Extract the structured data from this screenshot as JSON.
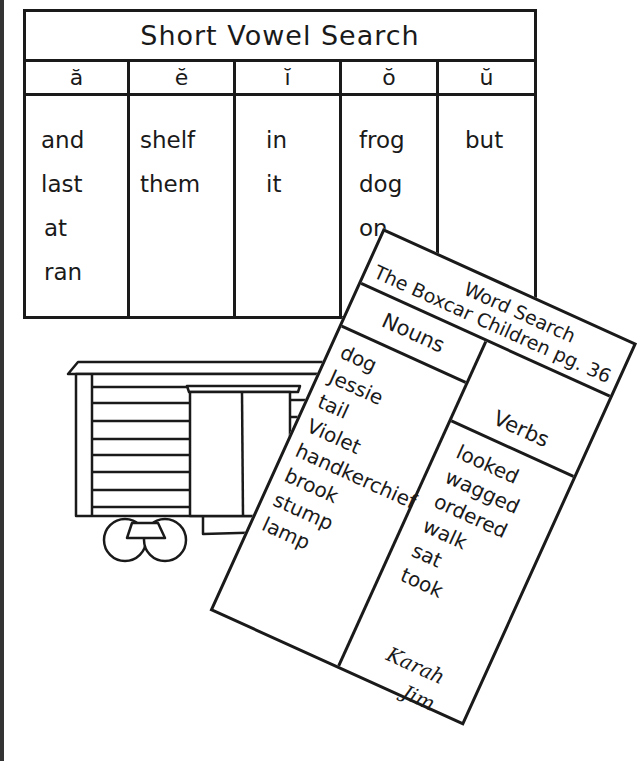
{
  "vowel_table": {
    "title": "Short Vowel Search",
    "columns": [
      {
        "header": "ă",
        "words": [
          "and",
          "last",
          "at",
          "ran"
        ]
      },
      {
        "header": "ĕ",
        "words": [
          "shelf",
          "them"
        ]
      },
      {
        "header": "ĭ",
        "words": [
          "in",
          "it"
        ]
      },
      {
        "header": "ŏ",
        "words": [
          "frog",
          "dog",
          "on"
        ]
      },
      {
        "header": "ŭ",
        "words": [
          "but"
        ]
      }
    ]
  },
  "word_search_card": {
    "title_line1": "Word Search",
    "title_line2": "The Boxcar Children pg. 36",
    "nouns_header": "Nouns",
    "verbs_header": "Verbs",
    "nouns": [
      "dog",
      "Jessie",
      "tail",
      "Violet",
      "handkerchief",
      "brook",
      "stump",
      "lamp"
    ],
    "verbs": [
      "looked",
      "wagged",
      "ordered",
      "walk",
      "sat",
      "took"
    ],
    "signatures": [
      "Karah",
      "Jim"
    ]
  },
  "illustration": {
    "subject": "boxcar-drawing",
    "line_color": "#1a1a1a",
    "background": "#ffffff"
  }
}
